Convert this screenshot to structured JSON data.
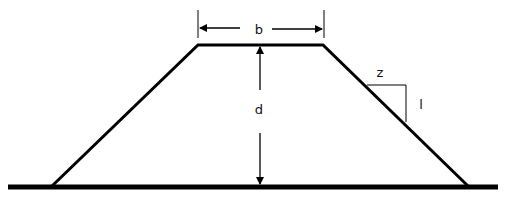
{
  "diagram": {
    "type": "trapezoidal-cross-section",
    "labels": {
      "top_width": "b",
      "depth": "d",
      "slope_horizontal": "z",
      "slope_vertical": "l"
    },
    "colors": {
      "stroke": "#000000",
      "background": "#ffffff"
    }
  }
}
